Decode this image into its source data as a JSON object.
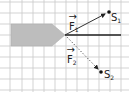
{
  "diagram": {
    "type": "force-vector-diagram",
    "grid": {
      "vertical_lines_x": [
        10,
        22,
        33,
        44,
        55,
        66,
        77,
        88,
        99,
        110,
        121
      ],
      "horizontal_lines_y": [
        2,
        13,
        24,
        35,
        46,
        57,
        68,
        79,
        90
      ],
      "color": "#c8c8c8"
    },
    "body_shape": {
      "description": "gray pointed bar (blunt arrow shape) pointing right",
      "fill": "#bdbdbd",
      "points": "11,24 52,24 65,35 52,46 11,46"
    },
    "reference_line": {
      "x1": 65,
      "y1": 35,
      "x2": 121,
      "y2": 35,
      "color": "#222222"
    },
    "vectors": [
      {
        "name": "F1",
        "label": "F",
        "subscript": "1",
        "style": "solid",
        "from": [
          65,
          35
        ],
        "to": [
          105,
          14
        ],
        "endpoint_label": "S",
        "endpoint_subscript": "1",
        "endpoint": [
          109,
          12
        ]
      },
      {
        "name": "F2",
        "label": "F",
        "subscript": "2",
        "style": "dotted",
        "from": [
          65,
          35
        ],
        "to": [
          98,
          69
        ],
        "endpoint_label": "S",
        "endpoint_subscript": "2",
        "endpoint": [
          101,
          72
        ]
      }
    ]
  }
}
